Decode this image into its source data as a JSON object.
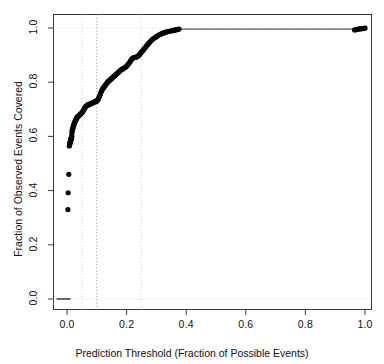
{
  "chart_data": {
    "type": "scatter",
    "title": "",
    "xlabel": "Prediction Threshold (Fraction of Possible Events)",
    "ylabel": "Fraction of Observed Events Covered",
    "xlim": [
      -0.035,
      1.035
    ],
    "ylim": [
      -0.04,
      1.04
    ],
    "xticks": [
      0.0,
      0.2,
      0.4,
      0.6,
      0.8,
      1.0
    ],
    "xtick_labels": [
      "0.0",
      "0.2",
      "0.4",
      "0.6",
      "0.8",
      "1.0"
    ],
    "yticks": [
      0.0,
      0.2,
      0.4,
      0.6,
      0.8,
      1.0
    ],
    "ytick_labels": [
      "0.0",
      "0.2",
      "0.4",
      "0.6",
      "0.8",
      "1.0"
    ],
    "grid": false,
    "legend": "none",
    "point_color": "#000000",
    "point_size": 2.6,
    "reference_lines": {
      "vertical": [
        {
          "x": 0.05,
          "style": "dotted",
          "color": "#c9c9c9"
        },
        {
          "x": 0.1,
          "style": "dotted",
          "color": "#8a8a8a"
        },
        {
          "x": 0.25,
          "style": "dotted",
          "color": "#c9c9c9"
        }
      ],
      "horizontal": [
        {
          "y": 0.0,
          "style": "dotted",
          "color": "#cfcfcf"
        },
        {
          "y": 1.0,
          "style": "dotted",
          "color": "#cfcfcf"
        }
      ]
    },
    "baseline_segment": {
      "x0": -0.035,
      "x1": 0.012,
      "y": 0.0,
      "color": "#444444"
    },
    "series": [
      {
        "name": "coverage",
        "x": [
          0.003,
          0.004,
          0.006,
          0.008,
          0.009,
          0.01,
          0.0105,
          0.011,
          0.0115,
          0.012,
          0.0125,
          0.013,
          0.0135,
          0.014,
          0.0145,
          0.015,
          0.0155,
          0.016,
          0.0165,
          0.017,
          0.018,
          0.019,
          0.02,
          0.021,
          0.0215,
          0.022,
          0.023,
          0.024,
          0.025,
          0.026,
          0.027,
          0.028,
          0.029,
          0.03,
          0.031,
          0.032,
          0.033,
          0.034,
          0.035,
          0.036,
          0.037,
          0.038,
          0.039,
          0.04,
          0.042,
          0.044,
          0.046,
          0.048,
          0.05,
          0.052,
          0.054,
          0.056,
          0.058,
          0.06,
          0.062,
          0.064,
          0.066,
          0.068,
          0.07,
          0.072,
          0.074,
          0.076,
          0.078,
          0.08,
          0.082,
          0.084,
          0.086,
          0.088,
          0.09,
          0.092,
          0.094,
          0.096,
          0.098,
          0.1,
          0.102,
          0.104,
          0.106,
          0.108,
          0.11,
          0.112,
          0.114,
          0.116,
          0.118,
          0.12,
          0.122,
          0.124,
          0.126,
          0.128,
          0.13,
          0.132,
          0.134,
          0.136,
          0.138,
          0.14,
          0.142,
          0.144,
          0.146,
          0.148,
          0.15,
          0.152,
          0.154,
          0.156,
          0.158,
          0.16,
          0.163,
          0.166,
          0.169,
          0.172,
          0.175,
          0.178,
          0.181,
          0.184,
          0.187,
          0.19,
          0.193,
          0.196,
          0.199,
          0.202,
          0.205,
          0.208,
          0.211,
          0.214,
          0.217,
          0.22,
          0.223,
          0.226,
          0.229,
          0.232,
          0.235,
          0.238,
          0.241,
          0.244,
          0.247,
          0.25,
          0.253,
          0.256,
          0.259,
          0.262,
          0.265,
          0.268,
          0.271,
          0.274,
          0.277,
          0.28,
          0.284,
          0.288,
          0.292,
          0.296,
          0.3,
          0.304,
          0.308,
          0.312,
          0.316,
          0.32,
          0.324,
          0.328,
          0.332,
          0.336,
          0.34,
          0.344,
          0.348,
          0.352,
          0.356,
          0.36,
          0.364,
          0.368,
          0.372,
          0.376,
          0.965,
          0.97,
          0.974,
          0.978,
          0.982,
          0.986,
          0.99,
          0.994,
          0.998,
          1.0
        ],
        "y": [
          0.33,
          0.392,
          0.46,
          0.565,
          0.57,
          0.575,
          0.578,
          0.58,
          0.582,
          0.584,
          0.586,
          0.588,
          0.59,
          0.592,
          0.594,
          0.596,
          0.598,
          0.6,
          0.612,
          0.62,
          0.624,
          0.628,
          0.632,
          0.636,
          0.638,
          0.64,
          0.643,
          0.646,
          0.649,
          0.652,
          0.655,
          0.658,
          0.66,
          0.662,
          0.664,
          0.666,
          0.668,
          0.67,
          0.672,
          0.673,
          0.674,
          0.675,
          0.676,
          0.677,
          0.679,
          0.681,
          0.683,
          0.685,
          0.687,
          0.69,
          0.694,
          0.698,
          0.702,
          0.706,
          0.709,
          0.711,
          0.713,
          0.715,
          0.716,
          0.717,
          0.718,
          0.719,
          0.72,
          0.721,
          0.722,
          0.723,
          0.724,
          0.725,
          0.726,
          0.727,
          0.728,
          0.729,
          0.73,
          0.731,
          0.733,
          0.736,
          0.74,
          0.745,
          0.751,
          0.757,
          0.763,
          0.768,
          0.772,
          0.776,
          0.779,
          0.782,
          0.785,
          0.788,
          0.791,
          0.794,
          0.797,
          0.8,
          0.802,
          0.804,
          0.806,
          0.808,
          0.81,
          0.812,
          0.814,
          0.816,
          0.818,
          0.82,
          0.822,
          0.824,
          0.827,
          0.83,
          0.833,
          0.836,
          0.839,
          0.842,
          0.845,
          0.847,
          0.849,
          0.851,
          0.853,
          0.855,
          0.858,
          0.862,
          0.866,
          0.87,
          0.875,
          0.88,
          0.885,
          0.888,
          0.89,
          0.891,
          0.892,
          0.893,
          0.894,
          0.896,
          0.899,
          0.903,
          0.907,
          0.911,
          0.915,
          0.919,
          0.923,
          0.927,
          0.931,
          0.935,
          0.939,
          0.943,
          0.947,
          0.951,
          0.955,
          0.959,
          0.962,
          0.965,
          0.968,
          0.971,
          0.974,
          0.976,
          0.978,
          0.98,
          0.982,
          0.984,
          0.985,
          0.986,
          0.987,
          0.988,
          0.989,
          0.99,
          0.991,
          0.992,
          0.993,
          0.994,
          0.995,
          0.996,
          0.993,
          0.994,
          0.995,
          0.996,
          0.997,
          0.997,
          0.998,
          0.998,
          0.999,
          1.0
        ]
      }
    ],
    "plateau_line": {
      "x0": 0.376,
      "x1": 1.0,
      "y": 0.996,
      "color": "#5a5a5a"
    }
  }
}
